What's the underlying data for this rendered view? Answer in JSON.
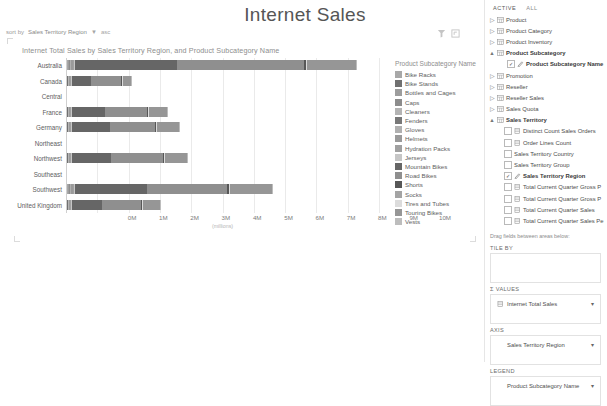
{
  "report": {
    "title": "Internet Sales",
    "sort_by_label": "sort by",
    "sort_by_field": "Sales Territory Region",
    "sort_arrow": "▼",
    "sort_dir": "asc",
    "tool_filter_icon": "filter-icon",
    "tool_focus_icon": "focus-mode-icon"
  },
  "chart_data": {
    "type": "bar",
    "orientation": "horizontal",
    "stacked": true,
    "title": "Internet Total Sales by Sales Territory Region, and Product Subcategory Name",
    "xlabel": "(millions)",
    "ylabel": "",
    "xlim": [
      0,
      10
    ],
    "xticks": [
      "0M",
      "1M",
      "2M",
      "3M",
      "4M",
      "5M",
      "6M",
      "7M",
      "8M",
      "9M",
      "10M"
    ],
    "grid": true,
    "legend_title": "Product Subcategory Name",
    "legend_position": "right",
    "categories": [
      "Australia",
      "Canada",
      "Central",
      "France",
      "Germany",
      "Northeast",
      "Northwest",
      "Southeast",
      "Southwest",
      "United Kingdom"
    ],
    "series": [
      {
        "name": "Bike Racks",
        "color": "#a8a8a8",
        "values": [
          0.02,
          0.01,
          0,
          0.01,
          0.01,
          0,
          0.01,
          0,
          0.02,
          0.01
        ]
      },
      {
        "name": "Bike Stands",
        "color": "#707070",
        "values": [
          0.02,
          0.01,
          0,
          0.01,
          0.01,
          0,
          0.01,
          0,
          0.02,
          0.01
        ]
      },
      {
        "name": "Bottles and Cages",
        "color": "#9d9d9d",
        "values": [
          0.02,
          0.01,
          0,
          0.01,
          0.01,
          0,
          0.01,
          0,
          0.02,
          0.01
        ]
      },
      {
        "name": "Caps",
        "color": "#8c8c8c",
        "values": [
          0.02,
          0.01,
          0,
          0.01,
          0.01,
          0,
          0.01,
          0,
          0.02,
          0.01
        ]
      },
      {
        "name": "Cleaners",
        "color": "#b4b4b4",
        "values": [
          0.01,
          0.01,
          0,
          0.01,
          0.01,
          0,
          0.01,
          0,
          0.01,
          0.01
        ]
      },
      {
        "name": "Fenders",
        "color": "#787878",
        "values": [
          0.02,
          0.01,
          0,
          0.01,
          0.01,
          0,
          0.01,
          0,
          0.02,
          0.01
        ]
      },
      {
        "name": "Gloves",
        "color": "#b0b0b0",
        "values": [
          0.02,
          0.01,
          0,
          0.01,
          0.01,
          0,
          0.01,
          0,
          0.02,
          0.01
        ]
      },
      {
        "name": "Helmets",
        "color": "#9a9a9a",
        "values": [
          0.05,
          0.03,
          0,
          0.03,
          0.03,
          0,
          0.03,
          0,
          0.05,
          0.03
        ]
      },
      {
        "name": "Hydration Packs",
        "color": "#a0a0a0",
        "values": [
          0.03,
          0.02,
          0,
          0.02,
          0.02,
          0,
          0.02,
          0,
          0.03,
          0.02
        ]
      },
      {
        "name": "Jerseys",
        "color": "#c6c6c6",
        "values": [
          0.06,
          0.03,
          0,
          0.03,
          0.04,
          0,
          0.04,
          0,
          0.06,
          0.04
        ]
      },
      {
        "name": "Mountain Bikes",
        "color": "#666666",
        "values": [
          3.25,
          0.62,
          0,
          1.05,
          1.2,
          0,
          1.25,
          0,
          2.3,
          0.95
        ]
      },
      {
        "name": "Road Bikes",
        "color": "#8f8f8f",
        "values": [
          4.05,
          0.95,
          0,
          1.35,
          1.45,
          0,
          1.65,
          0,
          2.55,
          1.25
        ]
      },
      {
        "name": "Shorts",
        "color": "#575757",
        "values": [
          0.06,
          0.03,
          0,
          0.03,
          0.03,
          0,
          0.03,
          0,
          0.05,
          0.03
        ]
      },
      {
        "name": "Socks",
        "color": "#a4a4a4",
        "values": [
          0.01,
          0.01,
          0,
          0.01,
          0.01,
          0,
          0.01,
          0,
          0.01,
          0.01
        ]
      },
      {
        "name": "Tires and Tubes",
        "color": "#dcdcdc",
        "values": [
          0.03,
          0.02,
          0,
          0.02,
          0.02,
          0,
          0.02,
          0,
          0.03,
          0.02
        ]
      },
      {
        "name": "Touring Bikes",
        "color": "#969696",
        "values": [
          1.55,
          0.28,
          0,
          0.6,
          0.7,
          0,
          0.7,
          0,
          1.35,
          0.55
        ]
      },
      {
        "name": "Vests",
        "color": "#bdbdbd",
        "values": [
          0.03,
          0.02,
          0,
          0.02,
          0.02,
          0,
          0.02,
          0,
          0.03,
          0.02
        ]
      }
    ],
    "totals": [
      "9.17",
      "2.00",
      "0",
      "3.18",
      "3.48",
      "0",
      "3.77",
      "0",
      "6.50",
      "2.93"
    ]
  },
  "pane": {
    "tabs": [
      {
        "label": "ACTIVE",
        "selected": true
      },
      {
        "label": "ALL",
        "selected": false
      }
    ],
    "fields": [
      {
        "label": "Product",
        "expander": "▷",
        "icon": "table-icon",
        "indent": 0,
        "bold": false,
        "checkbox": null
      },
      {
        "label": "Product Category",
        "expander": "▷",
        "icon": "table-icon",
        "indent": 0,
        "bold": false,
        "checkbox": null
      },
      {
        "label": "Product Inventory",
        "expander": "▷",
        "icon": "table-icon",
        "indent": 0,
        "bold": false,
        "checkbox": null
      },
      {
        "label": "Product Subcategory",
        "expander": "▲",
        "icon": "table-icon",
        "indent": 0,
        "bold": true,
        "checkbox": null
      },
      {
        "label": "Product Subcategory Name",
        "expander": "",
        "icon": "used-field-icon",
        "indent": 2,
        "bold": true,
        "checkbox": "used"
      },
      {
        "label": "Promotion",
        "expander": "▷",
        "icon": "table-icon",
        "indent": 0,
        "bold": false,
        "checkbox": null
      },
      {
        "label": "Reseller",
        "expander": "▷",
        "icon": "table-icon",
        "indent": 0,
        "bold": false,
        "checkbox": null
      },
      {
        "label": "Reseller Sales",
        "expander": "▷",
        "icon": "table-icon",
        "indent": 0,
        "bold": false,
        "checkbox": null
      },
      {
        "label": "Sales Quota",
        "expander": "▷",
        "icon": "table-icon",
        "indent": 0,
        "bold": false,
        "checkbox": null
      },
      {
        "label": "Sales Territory",
        "expander": "▲",
        "icon": "table-icon",
        "indent": 0,
        "bold": true,
        "checkbox": null
      },
      {
        "label": "Distinct Count Sales Orders",
        "expander": "",
        "icon": "measure-icon",
        "indent": 1,
        "bold": false,
        "checkbox": "off"
      },
      {
        "label": "Order Lines Count",
        "expander": "",
        "icon": "measure-icon",
        "indent": 1,
        "bold": false,
        "checkbox": "off"
      },
      {
        "label": "Sales Territory Country",
        "expander": "",
        "icon": "",
        "indent": 1,
        "bold": false,
        "checkbox": "off"
      },
      {
        "label": "Sales Territory Group",
        "expander": "",
        "icon": "",
        "indent": 1,
        "bold": false,
        "checkbox": "off"
      },
      {
        "label": "Sales Territory Region",
        "expander": "",
        "icon": "used-field-icon",
        "indent": 1,
        "bold": true,
        "checkbox": "used"
      },
      {
        "label": "Total Current Quarter Gross P",
        "expander": "",
        "icon": "measure-icon",
        "indent": 1,
        "bold": false,
        "checkbox": "off"
      },
      {
        "label": "Total Current Quarter Gross P",
        "expander": "",
        "icon": "measure-icon",
        "indent": 1,
        "bold": false,
        "checkbox": "off"
      },
      {
        "label": "Total Current Quarter Sales",
        "expander": "",
        "icon": "measure-icon",
        "indent": 1,
        "bold": false,
        "checkbox": "off"
      },
      {
        "label": "Total Current Quarter Sales Pe",
        "expander": "",
        "icon": "measure-icon",
        "indent": 1,
        "bold": false,
        "checkbox": "off"
      }
    ],
    "drag_hint": "Drag fields between areas below:",
    "wells": [
      {
        "label": "TILE BY",
        "sigma": false,
        "chip": null
      },
      {
        "label": "VALUES",
        "sigma": true,
        "chip": {
          "text": "Internet Total Sales",
          "icon": "measure-icon",
          "caret": "▾"
        }
      },
      {
        "label": "AXIS",
        "sigma": false,
        "chip": {
          "text": "Sales Territory Region",
          "icon": "",
          "caret": "▾"
        }
      },
      {
        "label": "LEGEND",
        "sigma": false,
        "chip": {
          "text": "Product Subcategory Name",
          "icon": "",
          "caret": "▾"
        }
      }
    ]
  }
}
